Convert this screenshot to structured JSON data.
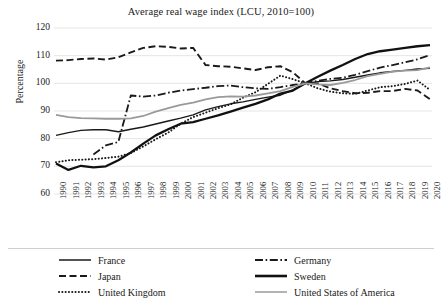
{
  "chart_data": {
    "type": "line",
    "title": "Average real wage index (LCU, 2010=100)",
    "xlabel": "",
    "ylabel": "Percentage",
    "ylim": [
      60,
      120
    ],
    "yticks": [
      60,
      70,
      80,
      90,
      100,
      110,
      120
    ],
    "grid": "horizontal",
    "legend_position": "bottom",
    "x": [
      1990,
      1991,
      1992,
      1993,
      1994,
      1995,
      1996,
      1997,
      1998,
      1999,
      2000,
      2001,
      2002,
      2003,
      2004,
      2005,
      2006,
      2007,
      2008,
      2009,
      2010,
      2011,
      2012,
      2013,
      2014,
      2015,
      2016,
      2017,
      2018,
      2019,
      2020
    ],
    "categories": [
      "1990",
      "1991",
      "1992",
      "1993",
      "1994",
      "1995",
      "1996",
      "1997",
      "1998",
      "1999",
      "2000",
      "2001",
      "2002",
      "2003",
      "2004",
      "2005",
      "2006",
      "2007",
      "2008",
      "2009",
      "2010",
      "2011",
      "2012",
      "2013",
      "2014",
      "2015",
      "2016",
      "2017",
      "2018",
      "2019",
      "2020"
    ],
    "series": [
      {
        "name": "France",
        "style": "solid",
        "color": "#1a1a1a",
        "width": 1.4,
        "values": [
          81.2,
          82.2,
          83.0,
          83.2,
          83.2,
          82.5,
          83.4,
          84.2,
          85.3,
          86.4,
          87.4,
          88.6,
          90.4,
          91.6,
          92.6,
          93.3,
          94.2,
          95.0,
          95.7,
          97.6,
          100.0,
          100.6,
          100.9,
          101.4,
          102.2,
          103.0,
          103.8,
          104.3,
          104.7,
          105.2,
          105.4
        ]
      },
      {
        "name": "Germany",
        "style": "dash-dot",
        "color": "#1a1a1a",
        "width": 1.8,
        "values": [
          null,
          null,
          null,
          74.3,
          77.6,
          78.8,
          95.6,
          95.2,
          95.6,
          96.6,
          97.4,
          97.9,
          98.4,
          99.0,
          99.2,
          98.6,
          98.2,
          98.0,
          98.6,
          99.4,
          100.0,
          100.9,
          101.6,
          102.0,
          103.1,
          104.4,
          105.7,
          106.6,
          107.6,
          108.7,
          110.2
        ]
      },
      {
        "name": "Japan",
        "style": "dashed",
        "color": "#1a1a1a",
        "width": 1.9,
        "values": [
          108.2,
          108.4,
          108.8,
          109.0,
          108.6,
          109.4,
          111.2,
          112.8,
          113.4,
          113.2,
          112.6,
          112.8,
          106.6,
          106.2,
          106.0,
          105.4,
          104.8,
          105.8,
          106.2,
          104.0,
          100.0,
          100.0,
          98.2,
          97.2,
          96.4,
          96.6,
          97.2,
          97.2,
          98.0,
          97.4,
          94.3
        ]
      },
      {
        "name": "Sweden",
        "style": "solid",
        "color": "#111111",
        "width": 2.3,
        "values": [
          71.0,
          68.7,
          70.2,
          69.6,
          70.0,
          72.2,
          75.0,
          78.2,
          81.2,
          83.4,
          85.4,
          86.0,
          87.2,
          88.4,
          89.8,
          91.2,
          92.6,
          94.2,
          96.3,
          97.4,
          100.0,
          102.4,
          104.6,
          106.6,
          108.8,
          110.6,
          111.6,
          112.2,
          112.8,
          113.4,
          113.8
        ]
      },
      {
        "name": "United Kingdom",
        "style": "dotted",
        "color": "#1a1a1a",
        "width": 2.0,
        "values": [
          71.5,
          72.2,
          72.4,
          72.6,
          73.0,
          73.5,
          74.8,
          77.2,
          79.8,
          82.2,
          85.4,
          87.8,
          89.4,
          91.0,
          92.4,
          94.8,
          96.8,
          99.8,
          102.8,
          101.5,
          100.0,
          98.2,
          97.0,
          96.4,
          96.2,
          97.4,
          98.6,
          99.0,
          99.8,
          101.0,
          97.6
        ]
      },
      {
        "name": "United States of America",
        "style": "solid",
        "color": "#9a9a9a",
        "width": 1.8,
        "values": [
          88.6,
          87.8,
          87.4,
          87.3,
          87.2,
          87.2,
          87.3,
          88.2,
          89.8,
          91.0,
          92.2,
          93.0,
          94.2,
          95.0,
          95.3,
          95.2,
          95.6,
          96.4,
          97.2,
          98.7,
          100.0,
          99.6,
          99.4,
          100.2,
          101.2,
          102.6,
          103.4,
          104.2,
          104.6,
          104.8,
          105.8
        ]
      }
    ]
  },
  "legend": {
    "items": [
      {
        "label": "France",
        "style": "solid",
        "color": "#1a1a1a"
      },
      {
        "label": "Germany",
        "style": "dash-dot",
        "color": "#1a1a1a"
      },
      {
        "label": "Japan",
        "style": "dashed",
        "color": "#1a1a1a"
      },
      {
        "label": "Sweden",
        "style": "solid-thick",
        "color": "#111111"
      },
      {
        "label": "United Kingdom",
        "style": "dotted",
        "color": "#1a1a1a"
      },
      {
        "label": "United States of America",
        "style": "solid",
        "color": "#9a9a9a"
      }
    ]
  }
}
